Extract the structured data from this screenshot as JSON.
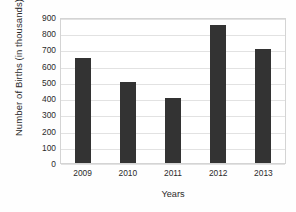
{
  "chart_data": {
    "type": "bar",
    "title": "",
    "subtitle": "",
    "xlabel": "Years",
    "ylabel": "Number of Births (in thousands)",
    "categories": [
      "2009",
      "2010",
      "2011",
      "2012",
      "2013"
    ],
    "values": [
      650,
      500,
      400,
      850,
      700
    ],
    "series": [
      {
        "name": "Number of Births",
        "values": [
          650,
          500,
          400,
          850,
          700
        ]
      }
    ],
    "ylim": [
      0,
      900
    ],
    "ytick_step": 100,
    "yticks": [
      "0",
      "100",
      "200",
      "300",
      "400",
      "500",
      "600",
      "700",
      "800",
      "900"
    ],
    "grid": true,
    "grid_axis": "y",
    "legend": false,
    "legend_position": "none",
    "bar_color": "#333333",
    "grid_color": "#e2e2e2",
    "plot_border_color": "#d4d4d4",
    "background_color": "#ffffff",
    "text_color": "#2b2b2b"
  }
}
